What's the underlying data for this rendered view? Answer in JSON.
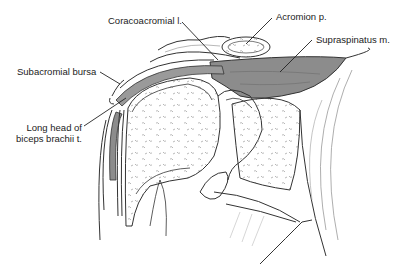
{
  "figure": {
    "colors": {
      "outline": "#333333",
      "muscle_fill": "#8c8c8c",
      "bursa_fill": "#9a9a9a",
      "bone_speckle": "#9a9a9a",
      "background": "#ffffff"
    },
    "labels": [
      {
        "id": "coracoacromial",
        "text": "Coracoacromial l."
      },
      {
        "id": "acromion",
        "text": "Acromion p."
      },
      {
        "id": "supraspinatus",
        "text": "Supraspinatus m."
      },
      {
        "id": "subacromial_bursa",
        "text": "Subacromial bursa"
      },
      {
        "id": "biceps_line1",
        "text": "Long head of"
      },
      {
        "id": "biceps_line2",
        "text": "biceps brachii t."
      }
    ]
  }
}
